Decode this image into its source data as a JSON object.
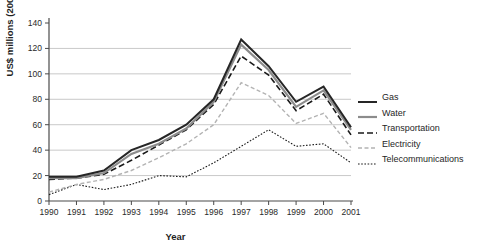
{
  "figure": {
    "background": "#ffffff",
    "gridline_color": "#c9c9c9",
    "axis_color": "#4a4a4a",
    "tick_label_color": "#2a2a2a"
  },
  "chart_data": {
    "type": "line",
    "title": "",
    "xlabel": "Year",
    "ylabel": "US$ millions (2001)",
    "x": [
      1990,
      1991,
      1992,
      1993,
      1994,
      1995,
      1996,
      1997,
      1998,
      1999,
      2000,
      2001
    ],
    "x_tick_labels": [
      "1990",
      "1991",
      "1992",
      "1993",
      "1994",
      "1995",
      "1996",
      "1997",
      "1998",
      "1999",
      "2000",
      "2001"
    ],
    "ylim": [
      0,
      140
    ],
    "ytick_step": 20,
    "y_tick_labels": [
      "0",
      "20",
      "40",
      "60",
      "80",
      "100",
      "120",
      "140"
    ],
    "grid": "horizontal, at 20-120 only",
    "legend_position": "right",
    "series": [
      {
        "name": "Gas",
        "color": "#262626",
        "width": 2,
        "dash": "",
        "values": [
          19,
          19,
          24,
          40,
          48,
          60,
          80,
          127,
          106,
          78,
          90,
          58
        ]
      },
      {
        "name": "Water",
        "color": "#8c8c8c",
        "width": 2.2,
        "dash": "",
        "values": [
          18,
          18,
          22,
          37,
          45,
          57,
          78,
          123,
          103,
          74,
          87,
          56
        ]
      },
      {
        "name": "Transportation",
        "color": "#1a1a1a",
        "width": 1.6,
        "dash": "6,3",
        "values": [
          17,
          18,
          21,
          32,
          44,
          56,
          76,
          114,
          99,
          71,
          84,
          52
        ]
      },
      {
        "name": "Electricity",
        "color": "#b3b3b3",
        "width": 1.4,
        "dash": "4,2.5",
        "values": [
          7,
          13,
          17,
          24,
          34,
          45,
          60,
          93,
          83,
          61,
          69,
          42
        ]
      },
      {
        "name": "Telecommunications",
        "color": "#1a1a1a",
        "width": 1.1,
        "dash": "1.6,1.6",
        "values": [
          5,
          13,
          9,
          13,
          20,
          19,
          30,
          43,
          56,
          43,
          45,
          30
        ]
      }
    ]
  }
}
